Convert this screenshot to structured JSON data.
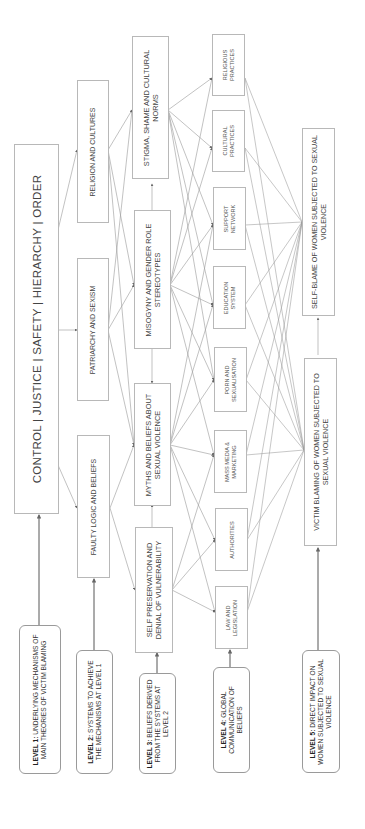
{
  "diagram": {
    "level1_box": {
      "text": "CONTROL | JUSTICE | SAFETY | HIERARCHY | ORDER"
    },
    "level2": [
      {
        "id": "religion",
        "text": "RELIGION AND CULTURES"
      },
      {
        "id": "patriarchy",
        "text": "PATRIARCHY AND SEXISM"
      },
      {
        "id": "faulty",
        "text": "FAULTY LOGIC AND BELIEFS"
      }
    ],
    "level3": [
      {
        "id": "stigma",
        "text": "STIGMA, SHAME AND CULTURAL NORMS"
      },
      {
        "id": "misogyny",
        "text": "MISOGYNY AND GENDER ROLE STEREOTYPES"
      },
      {
        "id": "myths",
        "text": "MYTHS AND BELIEFS ABOUT SEXUAL VIOLENCE"
      },
      {
        "id": "selfpres",
        "text": "SELF PRESERVATION AND DENIAL OF VULNERABILITY"
      }
    ],
    "level4": [
      {
        "id": "religious",
        "text": "RELIGIOUS PRACTICES"
      },
      {
        "id": "cultural",
        "text": "CULTURAL PRACTICES"
      },
      {
        "id": "support",
        "text": "SUPPORT NETWORK"
      },
      {
        "id": "education",
        "text": "EDUCATION SYSTEM"
      },
      {
        "id": "porn",
        "text": "PORN AND SEXUALISATION"
      },
      {
        "id": "media",
        "text": "MASS MEDIA & MARKETING"
      },
      {
        "id": "authorities",
        "text": "AUTHORITIES"
      },
      {
        "id": "law",
        "text": "LAW AND LEGISLATION"
      }
    ],
    "level5": [
      {
        "id": "selfblame",
        "text": "SELF-BLAME OF WOMEN SUBJECTED TO SEXUAL VIOLENCE"
      },
      {
        "id": "victimblame",
        "text": "VICTIM BLAMING OF WOMEN SUBJECTED TO SEXUAL VIOLENCE"
      }
    ],
    "level_labels": [
      {
        "level": "LEVEL 1:",
        "desc": "UNDERLYING MECHANISMS OF MAIN THEORIES OF VICTIM BLAMING"
      },
      {
        "level": "LEVEL 2:",
        "desc": "SYSTEMS TO ACHIEVE THE MECHANISMS AT LEVEL 1"
      },
      {
        "level": "LEVEL 3:",
        "desc": "BELIEFS DERIVED FROM THE SYSTEMS AT LEVEL 2"
      },
      {
        "level": "LEVEL 4:",
        "desc": "GLOBAL COMMUNICATION OF BELIEFS"
      },
      {
        "level": "LEVEL 5:",
        "desc": "DIRECT IMPACT ON WOMEN SUBJECTED TO SEXUAL VIOLENCE"
      }
    ],
    "colors": {
      "line": "#8a8a8a",
      "box_border": "#b8b8b8",
      "label_border": "#9a9a9a",
      "text": "#444444"
    },
    "orientation": "rotated 90° counter-clockwise; text reads bottom-to-top"
  }
}
